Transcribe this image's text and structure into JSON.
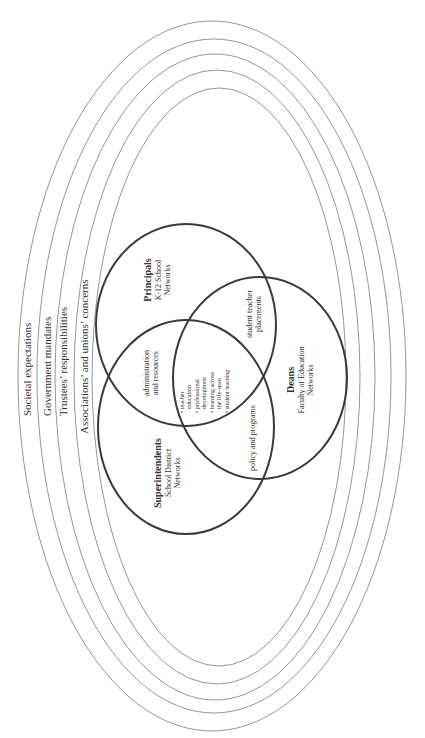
{
  "diagram": {
    "type": "nested-ellipses-venn",
    "orientation": "rotated-90-ccw",
    "colors": {
      "ring_stroke": "#8a8a8a",
      "circle_stroke": "#3a3a3a",
      "text": "#333333",
      "background": "#ffffff"
    },
    "rings": [
      {
        "label": "Societal expectations",
        "cx": 212,
        "cy": 376,
        "rx": 194,
        "ry": 355
      },
      {
        "label": "Government mandates",
        "cx": 214,
        "cy": 376,
        "rx": 177,
        "ry": 337
      },
      {
        "label": "Trustees’ responsibilities",
        "cx": 215,
        "cy": 377,
        "rx": 160,
        "ry": 323
      },
      {
        "label": "Associations’ and unions’ concerns",
        "cx": 217,
        "cy": 377,
        "rx": 143,
        "ry": 307
      },
      {
        "label": "",
        "cx": 219,
        "cy": 377,
        "rx": 127,
        "ry": 289
      }
    ],
    "circles": [
      {
        "id": "principals",
        "title": "Principals",
        "sub1": "K-12 School",
        "sub2": "Networks",
        "cx": 186,
        "cy": 325,
        "rx": 90,
        "ry": 101
      },
      {
        "id": "superintendents",
        "title": "Superintendents",
        "sub1": "School District",
        "sub2": "Networks",
        "cx": 186,
        "cy": 427,
        "rx": 88,
        "ry": 107
      },
      {
        "id": "deans",
        "title": "Deans",
        "sub1": "Faculty of Education",
        "sub2": "Networks",
        "cx": 260,
        "cy": 378,
        "rx": 87,
        "ry": 101
      }
    ],
    "overlaps": {
      "principals_superintendents": {
        "line1": "administration",
        "line2": "and resources"
      },
      "principals_deans": {
        "line1": "student teacher",
        "line2": "placements"
      },
      "superintendents_deans": {
        "line1": "policy and programs"
      },
      "center": {
        "items": [
          "• teacher",
          "  education",
          "• professional",
          "  development",
          "• learning across",
          "  the life-span",
          "• student learning"
        ]
      }
    }
  }
}
